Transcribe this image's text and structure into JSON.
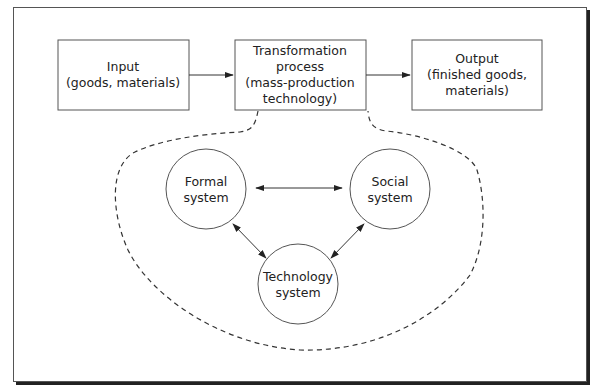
{
  "boxes": {
    "input": {
      "line1": "Input",
      "line2": "(goods, materials)"
    },
    "process": {
      "line1": "Transformation",
      "line2": "process",
      "line3": "(mass-production",
      "line4": "technology)"
    },
    "output": {
      "line1": "Output",
      "line2": "(finished goods,",
      "line3": "materials)"
    }
  },
  "circles": {
    "formal": {
      "line1": "Formal",
      "line2": "system"
    },
    "social": {
      "line1": "Social",
      "line2": "system"
    },
    "technology": {
      "line1": "Technology",
      "line2": "system"
    }
  },
  "colors": {
    "stroke": "#333333",
    "background": "#ffffff"
  }
}
